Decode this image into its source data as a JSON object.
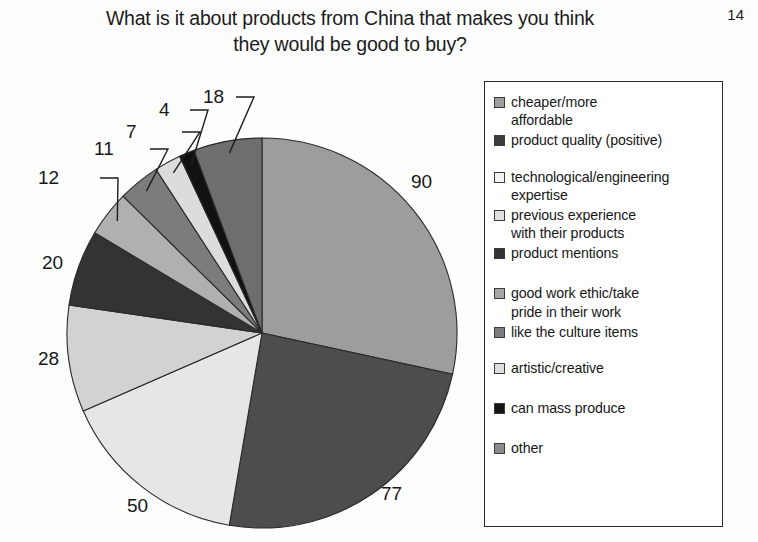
{
  "slide": {
    "page_number": "14",
    "title_line_1": "What is it about products from China that makes you think",
    "title_line_2": "they would be good to buy?"
  },
  "chart_data": {
    "type": "pie",
    "title": "What is it about products from China that makes you think they would be good to buy?",
    "total": 317,
    "start_angle_deg": 0,
    "direction": "clockwise",
    "legend_position": "right",
    "legend_border_color": "#2b2b2b",
    "slice_outline_color": "#2a2a2a",
    "categories": [
      "cheaper/more affordable",
      "product quality (positive)",
      "technological/engineering expertise",
      "previous experience with their products",
      "product mentions",
      "good work ethic/take pride in their work",
      "like the culture items",
      "artistic/creative",
      "can mass produce",
      "other"
    ],
    "values": [
      90,
      77,
      50,
      28,
      20,
      12,
      11,
      7,
      4,
      18
    ],
    "colors": [
      "#9d9d9d",
      "#4d4d4d",
      "#e6e6e6",
      "#d2d2d2",
      "#333333",
      "#b0b0b0",
      "#7c7c7c",
      "#dcdcdc",
      "#111111",
      "#6e6e6e"
    ],
    "slices": [
      {
        "label": "cheaper/more affordable",
        "value": 90,
        "value_text": "90",
        "color": "#9d9d9d",
        "label_style": "outside"
      },
      {
        "label": "product quality (positive)",
        "value": 77,
        "value_text": "77",
        "color": "#4d4d4d",
        "label_style": "outside"
      },
      {
        "label": "technological/engineering expertise",
        "value": 50,
        "value_text": "50",
        "color": "#e6e6e6",
        "label_style": "outside"
      },
      {
        "label": "previous experience with their products",
        "value": 28,
        "value_text": "28",
        "color": "#d2d2d2",
        "label_style": "outside"
      },
      {
        "label": "product mentions",
        "value": 20,
        "value_text": "20",
        "color": "#333333",
        "label_style": "outside"
      },
      {
        "label": "good work ethic/take pride in their work",
        "value": 12,
        "value_text": "12",
        "color": "#b0b0b0",
        "label_style": "leader"
      },
      {
        "label": "like the culture items",
        "value": 11,
        "value_text": "11",
        "color": "#7c7c7c",
        "label_style": "leader"
      },
      {
        "label": "artistic/creative",
        "value": 7,
        "value_text": "7",
        "color": "#dcdcdc",
        "label_style": "leader"
      },
      {
        "label": "can mass produce",
        "value": 4,
        "value_text": "4",
        "color": "#111111",
        "label_style": "leader"
      },
      {
        "label": "other",
        "value": 18,
        "value_text": "18",
        "color": "#6e6e6e",
        "label_style": "leader"
      }
    ]
  },
  "legend": {
    "items": [
      {
        "label": "cheaper/more\naffordable",
        "color": "#9d9d9d",
        "gap_after": "none"
      },
      {
        "label": "product quality (positive)",
        "color": "#3c3c3c",
        "gap_after": "md"
      },
      {
        "label": "technological/engineering\nexpertise",
        "color": "#f2f2f2",
        "gap_after": "none"
      },
      {
        "label": "previous experience\nwith their products",
        "color": "#e0e0e0",
        "gap_after": "none"
      },
      {
        "label": "product mentions",
        "color": "#333333",
        "gap_after": "lg"
      },
      {
        "label": "good work ethic/take\npride in their work",
        "color": "#a6a6a6",
        "gap_after": "none"
      },
      {
        "label": "like the culture items",
        "color": "#7c7c7c",
        "gap_after": "md"
      },
      {
        "label": "artistic/creative",
        "color": "#dedede",
        "gap_after": "lg"
      },
      {
        "label": "can mass produce",
        "color": "#161616",
        "gap_after": "lg"
      },
      {
        "label": "other",
        "color": "#8c8c8c",
        "gap_after": "none"
      }
    ]
  }
}
